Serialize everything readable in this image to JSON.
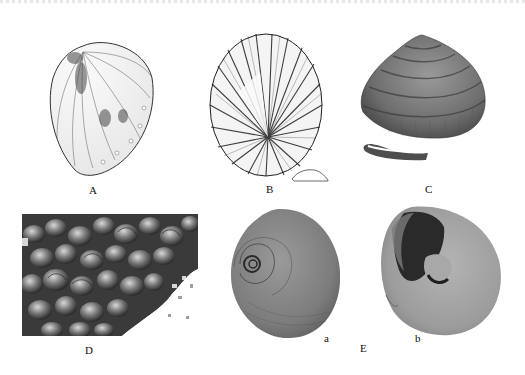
{
  "figure": {
    "panels": [
      {
        "id": "A",
        "label": "A",
        "kind": "line drawing",
        "subject": "ear-shaped shell (abalone-like), dorsal view"
      },
      {
        "id": "B",
        "label": "B",
        "kind": "line drawing",
        "subject": "limpet shell with radiating ribs, dorsal view, with small lateral outline"
      },
      {
        "id": "C",
        "label": "C",
        "kind": "photograph",
        "subject": "conical trochid shell, spiral ridges"
      },
      {
        "id": "D",
        "label": "D",
        "kind": "photograph",
        "subject": "dense cluster of small snails on substrate"
      },
      {
        "id": "E",
        "label": "E",
        "kind": "photograph",
        "subject": "globular moon-snail shell, two views",
        "subpanels": [
          {
            "id": "a",
            "label": "a",
            "subject": "apical view showing spire"
          },
          {
            "id": "b",
            "label": "b",
            "subject": "apertural view showing umbilicus"
          }
        ]
      }
    ]
  },
  "labels": {
    "A": "A",
    "B": "B",
    "C": "C",
    "D": "D",
    "E": "E",
    "a": "a",
    "b": "b"
  },
  "colors": {
    "background": "#ffffff",
    "ink": "#1a1a1a",
    "shell_gray": "#8a8a8a",
    "shell_dark": "#3a3a3a"
  }
}
